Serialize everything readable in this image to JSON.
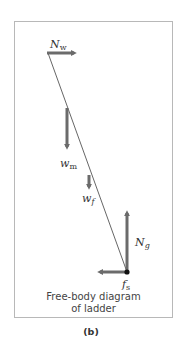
{
  "figure": {
    "panel_label": "(b)",
    "caption_line1": "Free-body diagram",
    "caption_line2": "of ladder"
  },
  "forces": [
    {
      "id": "N_w",
      "symbol": "N",
      "subscript": "w",
      "direction": "right",
      "meaning": "normal force from wall"
    },
    {
      "id": "w_m",
      "symbol": "w",
      "subscript": "m",
      "direction": "down",
      "meaning": "weight of man"
    },
    {
      "id": "w_f",
      "symbol": "w",
      "subscript": "f",
      "direction": "down",
      "meaning": "weight of ladder"
    },
    {
      "id": "N_g",
      "symbol": "N",
      "subscript": "g",
      "direction": "up",
      "meaning": "normal force from ground"
    },
    {
      "id": "f_s",
      "symbol": "f",
      "subscript": "s",
      "direction": "left",
      "meaning": "static friction"
    }
  ],
  "colors": {
    "arrow": "#6b6b6b",
    "ladder_line": "#555555",
    "frame": "#b8b8b8",
    "pivot": "#111111"
  }
}
